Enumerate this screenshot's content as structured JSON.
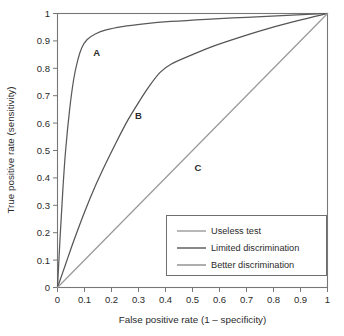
{
  "chart_data": {
    "type": "line",
    "title": "",
    "xlabel": "False positive rate (1 – specificity)",
    "ylabel": "True positive rate (sensitivity)",
    "xlim": [
      0,
      1
    ],
    "ylim": [
      0,
      1
    ],
    "grid": false,
    "legend_position": "bottom-right",
    "xticks": [
      "0",
      "0.1",
      "0.2",
      "0.3",
      "0.4",
      "0.5",
      "0.6",
      "0.7",
      "0.8",
      "0.9",
      "1"
    ],
    "yticks": [
      "0",
      "0.1",
      "0.2",
      "0.3",
      "0.4",
      "0.5",
      "0.6",
      "0.7",
      "0.8",
      "0.9",
      "1"
    ],
    "xtick_values": [
      0,
      0.1,
      0.2,
      0.3,
      0.4,
      0.5,
      0.6,
      0.7,
      0.8,
      0.9,
      1
    ],
    "ytick_values": [
      0,
      0.1,
      0.2,
      0.3,
      0.4,
      0.5,
      0.6,
      0.7,
      0.8,
      0.9,
      1
    ],
    "series": [
      {
        "name": "Better discrimination",
        "label": "A",
        "color": "#5a5a5a",
        "x": [
          0,
          0.01,
          0.02,
          0.03,
          0.045,
          0.06,
          0.075,
          0.09,
          0.11,
          0.14,
          0.18,
          0.24,
          0.32,
          0.42,
          0.55,
          0.7,
          0.85,
          1
        ],
        "y": [
          0,
          0.19,
          0.36,
          0.5,
          0.65,
          0.76,
          0.83,
          0.875,
          0.905,
          0.925,
          0.94,
          0.952,
          0.962,
          0.971,
          0.979,
          0.986,
          0.993,
          1
        ]
      },
      {
        "name": "Limited discrimination",
        "label": "B",
        "color": "#555555",
        "x": [
          0,
          0.03,
          0.06,
          0.1,
          0.14,
          0.18,
          0.22,
          0.26,
          0.3,
          0.34,
          0.38,
          0.42,
          0.5,
          0.58,
          0.68,
          0.78,
          0.89,
          1
        ],
        "y": [
          0,
          0.085,
          0.17,
          0.275,
          0.37,
          0.455,
          0.535,
          0.61,
          0.675,
          0.735,
          0.785,
          0.815,
          0.85,
          0.882,
          0.915,
          0.945,
          0.974,
          1
        ]
      },
      {
        "name": "Useless test",
        "label": "C",
        "color": "#9a9a9a",
        "x": [
          0,
          1
        ],
        "y": [
          0,
          1
        ]
      }
    ],
    "annotations": [
      {
        "text": "A",
        "x": 0.145,
        "y": 0.845
      },
      {
        "text": "B",
        "x": 0.3,
        "y": 0.615
      },
      {
        "text": "C",
        "x": 0.52,
        "y": 0.425
      }
    ],
    "legend": [
      {
        "label": "Useless test",
        "color": "#9a9a9a"
      },
      {
        "label": "Limited discrimination",
        "color": "#555555"
      },
      {
        "label": "Better discrimination",
        "color": "#8c8c8c"
      }
    ]
  }
}
